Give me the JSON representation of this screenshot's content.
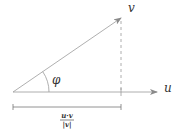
{
  "diagram": {
    "type": "vector-projection",
    "labels": {
      "vector_v": "v",
      "vector_u": "u",
      "angle": "φ",
      "projection_numerator": "u·v",
      "projection_denominator": "|v|"
    },
    "colors": {
      "line": "#9a9a9a",
      "text": "#333333",
      "background": "#ffffff"
    }
  }
}
